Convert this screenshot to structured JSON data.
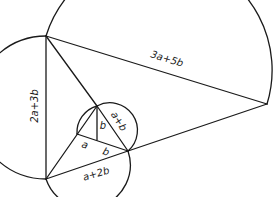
{
  "diagram": {
    "type": "geometric-construction",
    "labels": {
      "top_hypotenuse": "3a+5b",
      "left_side": "2a+3b",
      "bottom_side": "a+2b",
      "inner_hypotenuse": "a+b",
      "inner_vertical": "b",
      "inner_left_segment": "a",
      "inner_right_segment": "b"
    },
    "colors": {
      "stroke": "#1a1a1a",
      "background": "#ffffff"
    }
  }
}
